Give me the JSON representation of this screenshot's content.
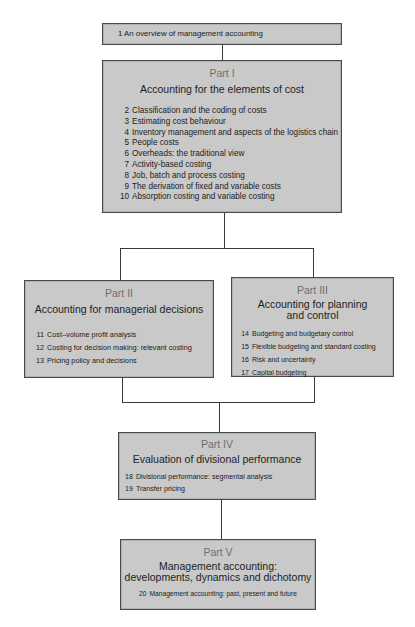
{
  "overview": {
    "num": "1",
    "label": "An overview of management accounting"
  },
  "parts": [
    {
      "label": "Part I",
      "title": "Accounting for the elements of cost",
      "chapters": [
        {
          "num": "2",
          "label": "Classification and the coding of costs"
        },
        {
          "num": "3",
          "label": "Estimating cost behaviour"
        },
        {
          "num": "4",
          "label": "Inventory management and aspects of the logistics chain"
        },
        {
          "num": "5",
          "label": "People costs"
        },
        {
          "num": "6",
          "label": "Overheads: the traditional  view"
        },
        {
          "num": "7",
          "label": "Activity-based costing"
        },
        {
          "num": "8",
          "label": "Job, batch and process costing"
        },
        {
          "num": "9",
          "label": "The derivation of fixed and variable costs"
        },
        {
          "num": "10",
          "label": "Absorption costing and variable costing"
        }
      ]
    },
    {
      "label": "Part II",
      "title": "Accounting for managerial decisions",
      "chapters": [
        {
          "num": "11",
          "label": "Cost–volume profit analysis"
        },
        {
          "num": "12",
          "label": "Costing for decision making: relevant costing"
        },
        {
          "num": "13",
          "label": "Pricing policy and decisions"
        }
      ]
    },
    {
      "label": "Part III",
      "title_line1": "Accounting for planning",
      "title_line2": "and control",
      "chapters": [
        {
          "num": "14",
          "label": "Budgeting and budgetary control"
        },
        {
          "num": "15",
          "label": "Flexible budgeting and standard costing"
        },
        {
          "num": "16",
          "label": "Risk and uncertainty"
        },
        {
          "num": "17",
          "label": "Capital budgeting"
        }
      ]
    },
    {
      "label": "Part IV",
      "title": "Evaluation of divisional performance",
      "chapters": [
        {
          "num": "18",
          "label": "Divisional  performance: segmental analysis"
        },
        {
          "num": "19",
          "label": "Transfer pricing"
        }
      ]
    },
    {
      "label": "Part V",
      "title_line1": "Management accounting:",
      "title_line2": "developments, dynamics and dichotomy",
      "chapters": [
        {
          "num": "20",
          "label": "Management accounting: past, present and future"
        }
      ]
    }
  ],
  "colors": {
    "box_fill": "#c9c9c9",
    "border": "#4a4a4a",
    "part_label": "#6e6e6e"
  }
}
